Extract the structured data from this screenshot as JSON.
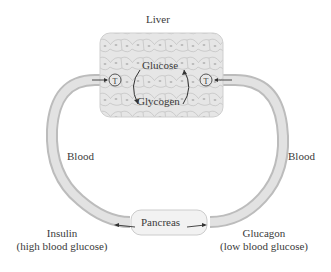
{
  "diagram": {
    "organ_top": "Liver",
    "liver_contents": {
      "top": "Glucose",
      "bottom": "Glycogen"
    },
    "transporter_symbol": "T",
    "left_vessel_label": "Blood",
    "right_vessel_label": "Blood",
    "organ_bottom": "Pancreas",
    "left_hormone": {
      "name": "Insulin",
      "condition": "(high blood glucose)"
    },
    "right_hormone": {
      "name": "Glucagon",
      "condition": "(low blood glucose)"
    },
    "colors": {
      "tube": "#d9d9d9",
      "tube_edge": "#bdbdbd",
      "liver_fill": "#e4e4e4",
      "cell_edge": "#c7c7c7",
      "text": "#333333"
    }
  }
}
